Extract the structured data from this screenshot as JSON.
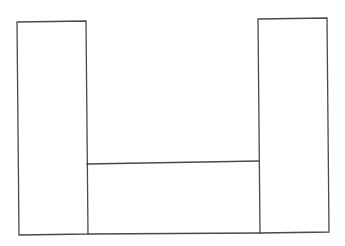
{
  "diagram": {
    "line_color": "#4a4a4a",
    "background": "#ffffff",
    "parts": [
      {
        "name": "left-pillar"
      },
      {
        "name": "right-pillar"
      },
      {
        "name": "middle-base"
      }
    ]
  }
}
